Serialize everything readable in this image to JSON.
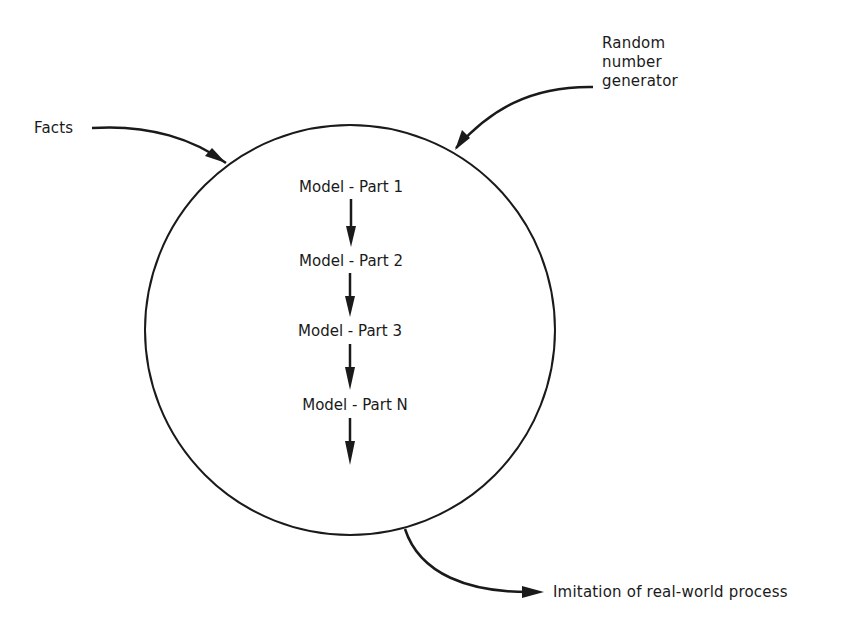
{
  "diagram": {
    "inputs": {
      "facts": "Facts",
      "random_number_generator": [
        "Random",
        "number",
        "generator"
      ]
    },
    "model_steps": [
      "Model - Part 1",
      "Model - Part 2",
      "Model - Part 3",
      "Model - Part N"
    ],
    "output": "Imitation of real-world process",
    "colors": {
      "ink": "#1a1a1a",
      "background": "#ffffff"
    }
  }
}
